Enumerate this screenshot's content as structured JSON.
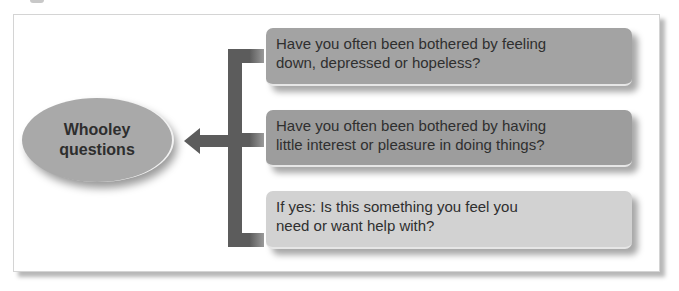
{
  "diagram": {
    "center": {
      "label_line1": "Whooley",
      "label_line2": "questions"
    },
    "questions": [
      {
        "line1": "Have you often been bothered by feeling",
        "line2": "down, depressed or hopeless?"
      },
      {
        "line1": "Have you often been bothered by having",
        "line2": "little interest or pleasure in doing things?"
      },
      {
        "line1": "If yes: Is this something you feel you",
        "line2": "need or want help with?"
      }
    ],
    "colors": {
      "ellipse": "#a9a9a9",
      "connector": "#5c5c5c",
      "box_dark": "#a3a3a3",
      "box_light": "#d2d2d2",
      "text": "#2f2f2f"
    }
  }
}
